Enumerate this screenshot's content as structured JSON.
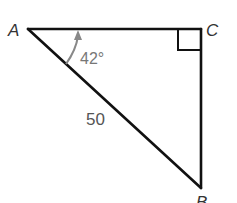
{
  "diagram": {
    "type": "right-triangle",
    "vertices": {
      "A": {
        "label": "A",
        "x": 28,
        "y": 29
      },
      "C": {
        "label": "C",
        "x": 201,
        "y": 29
      },
      "B": {
        "label": "B",
        "x": 201,
        "y": 188
      }
    },
    "angle_A": {
      "label": "42°",
      "value": 42,
      "unit": "degrees"
    },
    "right_angle_at": "C",
    "hypotenuse_AB": {
      "label": "50",
      "value": 50
    },
    "colors": {
      "stroke": "#111111",
      "angle_arc": "#888888",
      "label": "#333333"
    }
  }
}
